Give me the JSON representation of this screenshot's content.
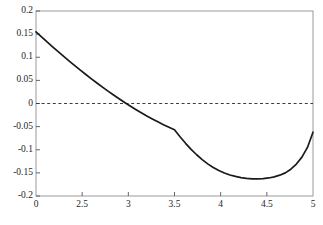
{
  "chart_data": {
    "type": "line",
    "title": "",
    "subtitle": "",
    "xlabel": "",
    "ylabel": "",
    "xlim": [
      0,
      5
    ],
    "ylim": [
      -0.2,
      0.2
    ],
    "grid": false,
    "legend": null,
    "background_color": "#ffffff",
    "frame_color": "#808080",
    "xtick_labels": [
      "0",
      "2.5",
      "3",
      "3.5",
      "4",
      "4.5",
      "5"
    ],
    "xtick_values": [
      0,
      2.5,
      3,
      3.5,
      4,
      4.5,
      5
    ],
    "ytick_labels": [
      "0.2",
      "0.15",
      "0.1",
      "0.05",
      "0",
      "-0.05",
      "-0.1",
      "-0.15",
      "-0.2"
    ],
    "ytick_values": [
      0.2,
      0.15,
      0.1,
      0.05,
      0,
      -0.05,
      -0.1,
      -0.15,
      -0.2
    ],
    "series": [
      {
        "name": "curve",
        "style": "solid",
        "color": "#1a1a1a",
        "width": 1.7,
        "x": [
          0.0,
          0.1,
          0.2,
          0.3,
          0.4,
          0.5,
          0.6,
          0.7,
          0.8,
          0.9,
          1.0,
          1.1,
          1.2,
          1.3,
          1.4,
          1.5,
          1.6,
          1.7,
          1.8,
          1.9,
          2.0,
          2.1,
          2.2,
          2.3,
          2.4,
          2.5,
          2.6,
          2.7,
          2.8,
          2.9,
          3.0,
          3.1,
          3.2,
          3.3,
          3.4,
          3.5,
          3.6,
          3.7,
          3.8,
          3.9,
          4.0,
          4.1,
          4.2,
          4.3,
          4.4,
          4.5,
          4.6,
          4.7,
          4.8,
          4.9,
          5.0
        ],
        "y": [
          0.155,
          0.144,
          0.1332,
          0.1226,
          0.1122,
          0.1019,
          0.0918,
          0.0819,
          0.0722,
          0.0627,
          0.0534,
          0.0443,
          0.0354,
          0.0268,
          0.0184,
          0.0102,
          0.0023,
          -0.0054,
          -0.0128,
          -0.0199,
          -0.0268,
          -0.0334,
          -0.0397,
          -0.0457,
          -0.0514,
          -0.0569,
          -0.072,
          -0.0861,
          -0.0991,
          -0.1108,
          -0.1213,
          -0.1305,
          -0.1384,
          -0.145,
          -0.1503,
          -0.1545,
          -0.1577,
          -0.1601,
          -0.1618,
          -0.1628,
          -0.163,
          -0.1625,
          -0.161,
          -0.1585,
          -0.155,
          -0.15,
          -0.142,
          -0.131,
          -0.116,
          -0.095,
          -0.062
        ]
      }
    ],
    "reference_lines": [
      {
        "name": "zero-line",
        "orientation": "horizontal",
        "value": 0,
        "style": "dashed",
        "color": "#3d3d3d"
      }
    ]
  },
  "axes": {
    "x_axis_name": "x-axis",
    "y_axis_name": "y-axis"
  }
}
